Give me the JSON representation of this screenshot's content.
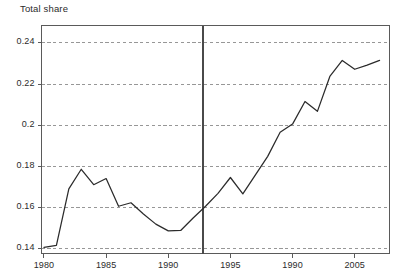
{
  "chart_data": {
    "type": "line",
    "title": "Total share",
    "xlabel": "",
    "ylabel": "",
    "xlim": [
      1979.8,
      2007.8
    ],
    "ylim": [
      0.1375,
      0.2485
    ],
    "grid": true,
    "grid_axis": "y",
    "legend": "none",
    "line_color": "#2b2b2b",
    "grid_color": "#8c8c8c",
    "axis_color": "#5a5a5a",
    "background": "#ffffff",
    "x_ticks": [
      1980,
      1985,
      1990,
      1995,
      2000,
      2005
    ],
    "x_tick_labels": [
      "1980",
      "1985",
      "1990",
      "1995",
      "1990",
      "2005"
    ],
    "y_ticks": [
      0.14,
      0.16,
      0.18,
      0.2,
      0.22,
      0.24
    ],
    "y_tick_labels": [
      "0.14",
      "0.16",
      "0.18",
      "0.2",
      "0.22",
      "0.24"
    ],
    "annotations": [
      {
        "name": "vertical-reference-line",
        "type": "vline",
        "x": 1992.8,
        "color": "#4a4a4a",
        "label": ""
      }
    ],
    "series": [
      {
        "name": "Total share",
        "x": [
          1980,
          1981,
          1982,
          1983,
          1984,
          1985,
          1986,
          1987,
          1988,
          1989,
          1990,
          1991,
          1992,
          1993,
          1994,
          1995,
          1996,
          1997,
          1998,
          1999,
          2000,
          2001,
          2002,
          2003,
          2004,
          2005,
          2006,
          2007
        ],
        "values": [
          0.1405,
          0.1415,
          0.169,
          0.1785,
          0.171,
          0.174,
          0.1605,
          0.1622,
          0.1567,
          0.1518,
          0.1485,
          0.1487,
          0.1548,
          0.1605,
          0.1668,
          0.1745,
          0.1665,
          0.1757,
          0.1848,
          0.1965,
          0.2005,
          0.2115,
          0.2067,
          0.2237,
          0.2315,
          0.2272,
          0.2292,
          0.2315
        ]
      }
    ]
  }
}
